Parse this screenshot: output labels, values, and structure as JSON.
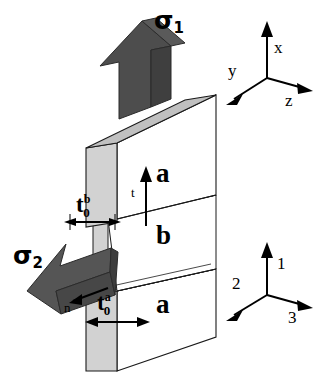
{
  "figure": {
    "background_color": "#ffffff"
  },
  "stresses": [
    {
      "id": "sigma1",
      "symbol": "σ",
      "subscript": "1",
      "direction": "up",
      "arrow_color": "#4d4d4d"
    },
    {
      "id": "sigma2",
      "symbol": "σ",
      "subscript": "2",
      "direction": "down-left",
      "arrow_color": "#555555"
    }
  ],
  "layers": [
    {
      "id": "layer-a-top",
      "label": "a"
    },
    {
      "id": "layer-b-middle",
      "label": "b"
    },
    {
      "id": "layer-a-bottom",
      "label": "a"
    }
  ],
  "dimensions": [
    {
      "id": "t0b",
      "base": "t",
      "superscript": "b",
      "subscript": "0",
      "meaning": "initial thickness of layer b"
    },
    {
      "id": "t0a",
      "base": "t",
      "superscript": "a",
      "subscript": "0",
      "meaning": "initial thickness of layer a"
    }
  ],
  "direction_labels": [
    {
      "id": "thickness-direction",
      "label": "t"
    },
    {
      "id": "surface-normal",
      "label": "n"
    }
  ],
  "axes": {
    "global_triad": {
      "id": "xyz-triad",
      "up": "x",
      "left": "y",
      "right": "z"
    },
    "material_triad": {
      "id": "123-triad",
      "up": "1",
      "left": "2",
      "right": "3"
    }
  },
  "colors": {
    "side_face": "#d2d2d2",
    "top_face": "#bdbdbd",
    "front_face": "#ffffff",
    "arrow_dark": "#4d4d4d",
    "arrow_mid": "#6a6a6a",
    "outline": "#000000"
  }
}
